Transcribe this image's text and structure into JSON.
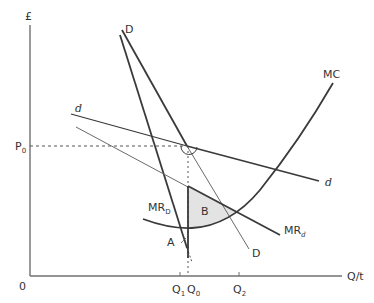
{
  "diagram": {
    "y_axis_label": "£",
    "x_axis_label": "Q/t",
    "origin_label": "0",
    "price_label": "P",
    "price_sub": "0",
    "q1_label": "Q",
    "q1_sub": "1",
    "q0_label": "Q",
    "q0_sub": "0",
    "q2_label": "Q",
    "q2_sub": "2",
    "curves": {
      "D_top_label": "D",
      "D_bottom_label": "D",
      "d_top_label": "d",
      "d_bottom_label": "d",
      "mc_label": "MC",
      "mr_D_label": "MR",
      "mr_D_sub": "D",
      "mr_d_label": "MR",
      "mr_d_sub": "d"
    },
    "regions": {
      "A_label": "A",
      "B_label": "B"
    },
    "colors": {
      "thick_line": "#3a3a3a",
      "thin_line": "#6a6a6a",
      "axis": "#707070",
      "shade_B": "#e3e3e3",
      "dashed": "#555555"
    }
  }
}
